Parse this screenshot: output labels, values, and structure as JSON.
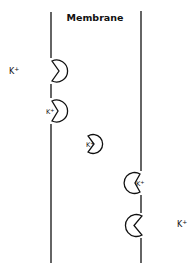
{
  "title": "Membrane",
  "ion_label": "K",
  "ion_charge": "+",
  "colors": {
    "stroke": "#111111",
    "background": "#ffffff"
  },
  "labels": {
    "outside_ion": "K+",
    "inside_ion": "K+"
  },
  "carriers": [
    {
      "id": 1,
      "state": "empty",
      "position": "left-membrane",
      "opening": "left"
    },
    {
      "id": 2,
      "state": "bound",
      "position": "left-membrane",
      "opening": "left",
      "ion": "K+"
    },
    {
      "id": 3,
      "state": "bound",
      "position": "mid-membrane",
      "opening": "left",
      "ion": "K+"
    },
    {
      "id": 4,
      "state": "bound",
      "position": "right-membrane",
      "opening": "right",
      "ion": "K+"
    },
    {
      "id": 5,
      "state": "empty",
      "position": "right-membrane",
      "opening": "right"
    }
  ]
}
